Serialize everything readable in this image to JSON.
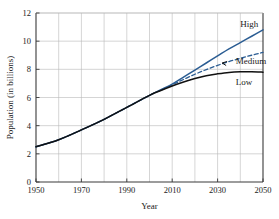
{
  "chart_data": {
    "type": "line",
    "title": "",
    "xlabel": "Year",
    "ylabel": "Population (in billions)",
    "xlim": [
      1950,
      2050
    ],
    "ylim": [
      0,
      12
    ],
    "xticks": [
      1950,
      1970,
      1990,
      2010,
      2030,
      2050
    ],
    "xtick_labels": [
      "1950",
      "1970",
      "1990",
      "2010",
      "2030",
      "2050"
    ],
    "x_minor_step": 10,
    "yticks": [
      0,
      2,
      4,
      6,
      8,
      10,
      12
    ],
    "ytick_labels": [
      "0",
      "2",
      "4",
      "6",
      "8",
      "10",
      "12"
    ],
    "grid": true,
    "legend_position": "inline-labels",
    "x": [
      1950,
      1960,
      1970,
      1980,
      1990,
      2000,
      2005,
      2010,
      2015,
      2020,
      2025,
      2030,
      2035,
      2040,
      2045,
      2050
    ],
    "series": [
      {
        "name": "High",
        "label": "High",
        "color": "#2b5d93",
        "style": "solid",
        "values": [
          2.5,
          3.0,
          3.7,
          4.45,
          5.3,
          6.15,
          6.55,
          6.95,
          7.45,
          7.95,
          8.45,
          8.95,
          9.45,
          9.9,
          10.35,
          10.8
        ]
      },
      {
        "name": "Medium",
        "label": "Medium",
        "color": "#2b5d93",
        "style": "dashed",
        "values": [
          2.5,
          3.0,
          3.7,
          4.45,
          5.3,
          6.15,
          6.52,
          6.9,
          7.28,
          7.65,
          7.98,
          8.28,
          8.55,
          8.78,
          9.0,
          9.2
        ]
      },
      {
        "name": "Low",
        "label": "Low",
        "color": "#111111",
        "style": "solid",
        "values": [
          2.5,
          3.0,
          3.7,
          4.45,
          5.3,
          6.15,
          6.5,
          6.82,
          7.1,
          7.35,
          7.55,
          7.68,
          7.78,
          7.82,
          7.82,
          7.8
        ]
      }
    ],
    "annotations": [
      {
        "text": "High",
        "x": 2040,
        "y": 11.2
      },
      {
        "text": "Medium",
        "x": 2038,
        "y": 8.6
      },
      {
        "text": "Low",
        "x": 2038,
        "y": 7.1
      }
    ],
    "colors": {
      "blue": "#2b5d93",
      "black": "#111111",
      "grid": "#b8b8b8",
      "axis": "#333333",
      "background": "#ffffff"
    }
  }
}
